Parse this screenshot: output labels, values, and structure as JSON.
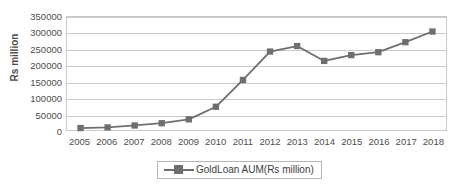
{
  "chart_data": {
    "type": "line",
    "title": "",
    "xlabel": "",
    "ylabel": "Rs million",
    "categories": [
      "2005",
      "2006",
      "2007",
      "2008",
      "2009",
      "2010",
      "2011",
      "2012",
      "2013",
      "2014",
      "2015",
      "2016",
      "2017",
      "2018"
    ],
    "series": [
      {
        "name": "GoldLoan AUM(Rs million)",
        "values": [
          6000,
          8000,
          14000,
          21000,
          33000,
          72000,
          155000,
          243000,
          260000,
          214000,
          232000,
          241000,
          272000,
          305000
        ]
      }
    ],
    "ylim": [
      0,
      350000
    ],
    "y_ticks": [
      "0",
      "50000",
      "100000",
      "150000",
      "200000",
      "250000",
      "300000",
      "350000"
    ],
    "y_tick_values": [
      0,
      50000,
      100000,
      150000,
      200000,
      250000,
      300000,
      350000
    ],
    "grid": true,
    "legend_position": "bottom",
    "marker": "square",
    "colors": {
      "series": "#6e6e6e",
      "gridline": "#c9c9c9",
      "text": "#4d4d4d",
      "plot_border": "#c9c9c9",
      "background": "#ffffff"
    }
  },
  "legend": {
    "entries": [
      {
        "label": "GoldLoan AUM(Rs million)"
      }
    ]
  }
}
